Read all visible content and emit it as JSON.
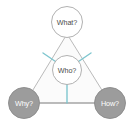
{
  "diagram": {
    "canvas": {
      "width": 134,
      "height": 127,
      "background": "#ffffff"
    },
    "shapes": {
      "triangle": {
        "name": "outer-triangle",
        "fill": "#fbfbfb",
        "stroke": "#b2b2b2",
        "stroke_width": 0.9,
        "points": "67,34 25,103 110,103"
      },
      "baseline": {
        "name": "baseline-connector",
        "stroke": "#9a9a9a",
        "stroke_width": 1.1,
        "x1": 40,
        "y1": 103,
        "x2": 95,
        "y2": 103
      }
    },
    "nodes": [
      {
        "id": "what",
        "label": "What?",
        "cx": 67,
        "cy": 22,
        "r": 15.5,
        "fill": "#ffffff",
        "stroke": "#a8a8a8",
        "stroke_width": 0.9,
        "text_color": "#4a4a4a",
        "position": "top-vertex"
      },
      {
        "id": "who",
        "label": "Who?",
        "cx": 67,
        "cy": 70,
        "r": 14.5,
        "fill": "#ffffff",
        "stroke": "#a8a8a8",
        "stroke_width": 0.9,
        "text_color": "#4a4a4a",
        "position": "center"
      },
      {
        "id": "why",
        "label": "Why?",
        "cx": 24,
        "cy": 103,
        "r": 15.5,
        "fill": "#9c9c9c",
        "stroke": "#8a8a8a",
        "stroke_width": 0.9,
        "text_color": "#ffffff",
        "position": "bottom-left-vertex"
      },
      {
        "id": "how",
        "label": "How?",
        "cx": 110,
        "cy": 103,
        "r": 15.5,
        "fill": "#9c9c9c",
        "stroke": "#8a8a8a",
        "stroke_width": 0.9,
        "text_color": "#ffffff",
        "position": "bottom-right-vertex"
      }
    ],
    "spokes": {
      "color": "#7ec6cf",
      "stroke_width": 1.4,
      "lines": [
        {
          "id": "who-to-left-edge",
          "x1": 55.5,
          "y1": 61.5,
          "x2": 43,
          "y2": 53
        },
        {
          "id": "who-to-right-edge",
          "x1": 78.5,
          "y1": 61.5,
          "x2": 91,
          "y2": 53
        },
        {
          "id": "who-to-baseline",
          "x1": 67,
          "y1": 84.5,
          "x2": 67,
          "y2": 103
        }
      ]
    }
  }
}
